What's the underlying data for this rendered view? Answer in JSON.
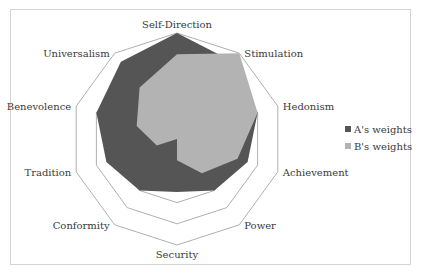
{
  "chart_data": {
    "type": "radar",
    "title": "",
    "categories": [
      "Self-Direction",
      "Stimulation",
      "Hedonism",
      "Achievement",
      "Power",
      "Security",
      "Conformity",
      "Tradition",
      "Benevolence",
      "Universalism"
    ],
    "series": [
      {
        "name": "A's weights",
        "color": "#555555",
        "values": [
          1.0,
          0.9,
          0.8,
          0.7,
          0.6,
          0.5,
          0.6,
          0.7,
          0.8,
          0.9
        ]
      },
      {
        "name": "B's weights",
        "color": "#b3b3b3",
        "values": [
          0.8,
          1.0,
          0.8,
          0.6,
          0.4,
          0.2,
          0.0,
          0.2,
          0.4,
          0.6
        ]
      }
    ],
    "rlim": [
      0,
      1
    ],
    "grid_rings": [
      0.2,
      0.4,
      0.6,
      0.8,
      1.0
    ],
    "grid": true,
    "grid_color": "#9a9a9a",
    "legend_position": "right"
  },
  "legend": {
    "items": [
      {
        "label": "A's weights",
        "color": "#555555"
      },
      {
        "label": "B's weights",
        "color": "#b3b3b3"
      }
    ]
  }
}
